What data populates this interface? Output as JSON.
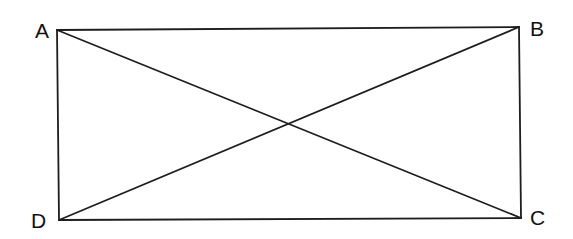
{
  "diagram": {
    "type": "rectangle-with-diagonals",
    "vertices": {
      "A": {
        "label": "A",
        "x": 57,
        "y": 30,
        "label_x": 35,
        "label_y": 38
      },
      "B": {
        "label": "B",
        "x": 519,
        "y": 27,
        "label_x": 530,
        "label_y": 36
      },
      "C": {
        "label": "C",
        "x": 521,
        "y": 218,
        "label_x": 530,
        "label_y": 225
      },
      "D": {
        "label": "D",
        "x": 59,
        "y": 220,
        "label_x": 31,
        "label_y": 228
      }
    },
    "sides": [
      "AB",
      "BC",
      "CD",
      "DA"
    ],
    "diagonals": [
      "AC",
      "BD"
    ],
    "stroke_color": "#1e1e1e",
    "background": "#ffffff"
  }
}
